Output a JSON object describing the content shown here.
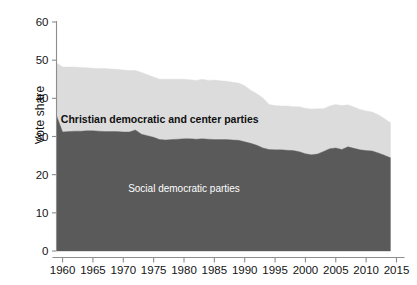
{
  "chart_data": {
    "type": "area",
    "stacked": true,
    "title": "",
    "subtitle": "",
    "xlabel": "",
    "ylabel": "Vote share",
    "xlim": [
      1959,
      2015
    ],
    "ylim": [
      0,
      60
    ],
    "grid": false,
    "legend_position": "inline-annotations",
    "x_ticks": [
      1960,
      1965,
      1970,
      1975,
      1980,
      1985,
      1990,
      1995,
      2000,
      2005,
      2010,
      2015
    ],
    "y_ticks": [
      0,
      10,
      20,
      30,
      40,
      50,
      60
    ],
    "annotations": [
      {
        "name": "upper-band-label",
        "text": "Christian democratic and center parties",
        "x": 1976,
        "y": 33.5,
        "color": "#101010",
        "bold": true
      },
      {
        "name": "lower-band-label",
        "text": "Social democratic parties",
        "x": 1980,
        "y": 15.5,
        "color": "#ffffff",
        "bold": false
      }
    ],
    "colors": {
      "social_democratic": "#5a5a5a",
      "christian_democratic": "#dcdcdc",
      "axis": "#8d8d8d",
      "text": "#141414",
      "background": "#ffffff"
    },
    "x": [
      1959,
      1960,
      1961,
      1962,
      1963,
      1964,
      1965,
      1966,
      1967,
      1968,
      1969,
      1970,
      1971,
      1972,
      1973,
      1974,
      1975,
      1976,
      1977,
      1978,
      1979,
      1980,
      1981,
      1982,
      1983,
      1984,
      1985,
      1986,
      1987,
      1988,
      1989,
      1990,
      1991,
      1992,
      1993,
      1994,
      1995,
      1996,
      1997,
      1998,
      1999,
      2000,
      2001,
      2002,
      2003,
      2004,
      2005,
      2006,
      2007,
      2008,
      2009,
      2010,
      2011,
      2012,
      2013,
      2014
    ],
    "series": [
      {
        "name": "Social democratic parties",
        "color": "#5a5a5a",
        "values": [
          35.5,
          31.2,
          31.3,
          31.4,
          31.4,
          31.5,
          31.5,
          31.4,
          31.3,
          31.3,
          31.3,
          31.2,
          31.2,
          31.7,
          30.6,
          30.2,
          29.8,
          29.2,
          29.1,
          29.2,
          29.3,
          29.4,
          29.4,
          29.3,
          29.4,
          29.3,
          29.2,
          29.2,
          29.2,
          29.1,
          29.0,
          28.6,
          28.2,
          27.7,
          27.0,
          26.6,
          26.5,
          26.5,
          26.4,
          26.3,
          26.0,
          25.5,
          25.2,
          25.4,
          26.1,
          26.8,
          27.0,
          26.6,
          27.3,
          26.9,
          26.5,
          26.3,
          26.2,
          25.7,
          25.1,
          24.4
        ]
      },
      {
        "name": "Christian democratic and center parties",
        "color": "#dcdcdc",
        "values": [
          13.8,
          17.0,
          16.9,
          16.8,
          16.7,
          16.5,
          16.4,
          16.4,
          16.5,
          16.4,
          16.3,
          16.2,
          16.1,
          15.6,
          16.2,
          16.0,
          15.8,
          15.8,
          15.9,
          15.8,
          15.7,
          15.6,
          15.5,
          15.4,
          15.6,
          15.4,
          15.6,
          15.4,
          15.3,
          15.1,
          15.0,
          14.7,
          13.9,
          13.5,
          13.1,
          11.8,
          11.6,
          11.5,
          11.6,
          11.5,
          11.8,
          11.9,
          12.0,
          11.9,
          11.2,
          11.2,
          11.4,
          11.5,
          11.0,
          10.8,
          10.6,
          10.4,
          10.2,
          10.0,
          9.6,
          9.2
        ]
      }
    ],
    "totals": [
      49.3,
      48.2,
      48.2,
      48.2,
      48.1,
      48.0,
      47.9,
      47.8,
      47.8,
      47.7,
      47.6,
      47.4,
      47.3,
      47.3,
      46.8,
      46.2,
      45.6,
      45.0,
      45.0,
      45.0,
      45.0,
      45.0,
      44.9,
      44.7,
      45.0,
      44.7,
      44.8,
      44.6,
      44.5,
      44.2,
      44.0,
      43.3,
      42.1,
      41.2,
      40.1,
      38.4,
      38.1,
      38.0,
      38.0,
      37.8,
      37.8,
      37.4,
      37.2,
      37.3,
      37.3,
      38.0,
      38.4,
      38.1,
      38.3,
      37.7,
      37.1,
      36.7,
      36.4,
      35.7,
      34.7,
      33.6
    ]
  }
}
